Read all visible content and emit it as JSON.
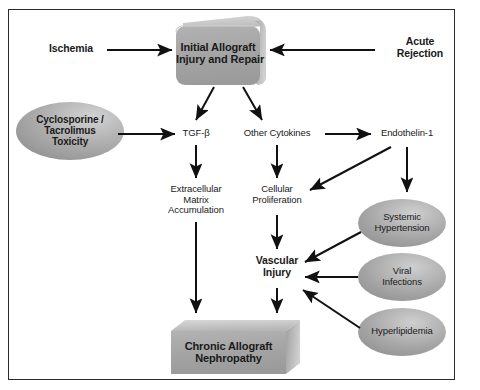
{
  "figure": {
    "background": "#ffffff",
    "border_color": "#2b2b2b",
    "fill_gray": "#a8a8a8",
    "fill_gray_light": "#c9c9c9",
    "fill_gray_dark": "#8f8f8f",
    "arrow_color": "#111111"
  },
  "nodes": {
    "ischemia": {
      "label": "Ischemia"
    },
    "acute_rejection": {
      "line1": "Acute",
      "line2": "Rejection"
    },
    "initial_injury": {
      "line1": "Initial Allograft",
      "line2": "Injury and Repair"
    },
    "cni_toxicity": {
      "line1": "Cyclosporine /",
      "line2": "Tacrolimus",
      "line3": "Toxicity"
    },
    "tgf_beta": {
      "label": "TGF-β"
    },
    "other_cytokines": {
      "label": "Other Cytokines"
    },
    "endothelin": {
      "label": "Endothelin-1"
    },
    "ecm": {
      "line1": "Extracellular",
      "line2": "Matrix",
      "line3": "Accumulation"
    },
    "cellular_proliferation": {
      "line1": "Cellular",
      "line2": "Proliferation"
    },
    "vascular_injury": {
      "line1": "Vascular",
      "line2": "Injury"
    },
    "systemic_hypertension": {
      "line1": "Systemic",
      "line2": "Hypertension"
    },
    "viral_infections": {
      "line1": "Viral",
      "line2": "Infections"
    },
    "hyperlipidemia": {
      "label": "Hyperlipidemia"
    },
    "chronic_allograft_nephropathy": {
      "line1": "Chronic Allograft",
      "line2": "Nephropathy"
    }
  },
  "edges": [
    {
      "from": "ischemia",
      "to": "initial_injury"
    },
    {
      "from": "acute_rejection",
      "to": "initial_injury"
    },
    {
      "from": "initial_injury",
      "to": "tgf_beta"
    },
    {
      "from": "initial_injury",
      "to": "other_cytokines"
    },
    {
      "from": "cni_toxicity",
      "to": "tgf_beta"
    },
    {
      "from": "other_cytokines",
      "to": "endothelin"
    },
    {
      "from": "tgf_beta",
      "to": "ecm"
    },
    {
      "from": "other_cytokines",
      "to": "cellular_proliferation"
    },
    {
      "from": "endothelin",
      "to": "cellular_proliferation"
    },
    {
      "from": "endothelin",
      "to": "systemic_hypertension"
    },
    {
      "from": "cellular_proliferation",
      "to": "vascular_injury"
    },
    {
      "from": "systemic_hypertension",
      "to": "vascular_injury"
    },
    {
      "from": "viral_infections",
      "to": "vascular_injury"
    },
    {
      "from": "hyperlipidemia",
      "to": "vascular_injury"
    },
    {
      "from": "ecm",
      "to": "chronic_allograft_nephropathy"
    },
    {
      "from": "vascular_injury",
      "to": "chronic_allograft_nephropathy"
    }
  ]
}
